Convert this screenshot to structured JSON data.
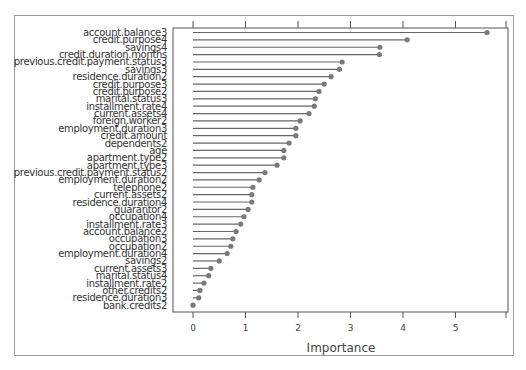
{
  "chart_data": {
    "type": "lollipop",
    "orientation": "horizontal",
    "title": "",
    "xlabel": "Importance",
    "ylabel": "",
    "xlim": [
      -0.35,
      5.95
    ],
    "xticks": [
      0,
      1,
      2,
      3,
      4,
      5
    ],
    "grid": false,
    "legend": null,
    "colors": {
      "line": "#666666",
      "point": "#7a7a7a",
      "axis": "#555555",
      "frame": "#999999"
    },
    "categories": [
      "account.balance3",
      "credit.purpose4",
      "savings4",
      "credit.duration.months",
      "previous.credit.payment.status3",
      "savings3",
      "residence.duration2",
      "credit.purpose3",
      "credit.purpose2",
      "marital.status3",
      "installment.rate4",
      "current.assets4",
      "foreign.worker2",
      "employment.duration3",
      "credit.amount",
      "dependents2",
      "age",
      "apartment.type2",
      "apartment.type3",
      "previous.credit.payment.status2",
      "employment.duration2",
      "telephone2",
      "current.assets2",
      "residence.duration4",
      "guarantor2",
      "occupation4",
      "installment.rate3",
      "account.balance2",
      "occupation3",
      "occupation2",
      "employment.duration4",
      "savings2",
      "current.assets3",
      "marital.status4",
      "installment.rate2",
      "other.credits2",
      "residence.duration3",
      "bank.credits2"
    ],
    "values": [
      5.6,
      4.08,
      3.56,
      3.55,
      2.84,
      2.79,
      2.63,
      2.5,
      2.4,
      2.33,
      2.31,
      2.21,
      2.04,
      1.96,
      1.96,
      1.83,
      1.73,
      1.73,
      1.6,
      1.37,
      1.26,
      1.14,
      1.12,
      1.12,
      1.05,
      0.97,
      0.91,
      0.82,
      0.76,
      0.72,
      0.65,
      0.5,
      0.34,
      0.3,
      0.21,
      0.13,
      0.11,
      0.0
    ]
  }
}
